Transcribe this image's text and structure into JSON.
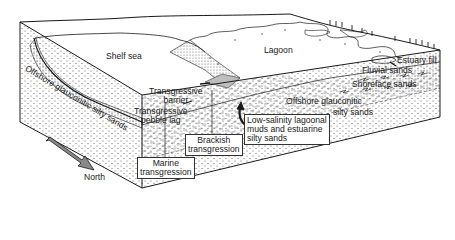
{
  "diagram": {
    "type": "block-diagram",
    "surface_labels": {
      "shelf_sea": "Shelf sea",
      "lagoon": "Lagoon"
    },
    "facies_labels": {
      "offshore_left": "Offshore glauconitic silty sands",
      "offshore_right_line1": "Offshore glauconitic",
      "offshore_right_line2": "silty sands",
      "transgressive_barrier_line1": "Transgressive",
      "transgressive_barrier_line2": "barrier",
      "pebble_lag_line1": "Transgressive",
      "pebble_lag_line2": "pebble lag",
      "estuary_fill": "Estuary fill",
      "fluvial_sands": "Fluvial sands",
      "shoreface_sands": "Shoreface sands"
    },
    "boxed_labels": {
      "low_salinity_line1": "Low-salinity lagoonal",
      "low_salinity_line2": "muds and estuarine",
      "low_salinity_line3": "silty sands",
      "brackish_line1": "Brackish",
      "brackish_line2": "transgression",
      "marine_line1": "Marine",
      "marine_line2": "transgression"
    },
    "compass": {
      "label": "North",
      "icon": "north-arrow-icon"
    },
    "colors": {
      "line": "#1a1a1a",
      "background": "#ffffff",
      "stipple": "#555555",
      "barrier_fill": "#bdbdbd"
    }
  }
}
